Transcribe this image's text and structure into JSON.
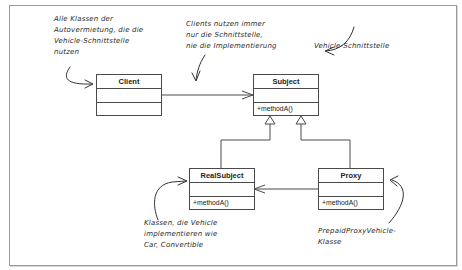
{
  "diagram": {
    "type": "UML class diagram (Proxy pattern)",
    "classes": [
      {
        "id": "client",
        "name": "Client",
        "attributes": "",
        "operations": ""
      },
      {
        "id": "subject",
        "name": "Subject",
        "attributes": "",
        "operations": "+methodA()"
      },
      {
        "id": "realsubject",
        "name": "RealSubject",
        "attributes": "",
        "operations": "+methodA()"
      },
      {
        "id": "proxy",
        "name": "Proxy",
        "attributes": "",
        "operations": "+methodA()"
      }
    ],
    "relations": [
      {
        "from": "Client",
        "to": "Subject",
        "type": "association"
      },
      {
        "from": "RealSubject",
        "to": "Subject",
        "type": "generalization"
      },
      {
        "from": "Proxy",
        "to": "Subject",
        "type": "generalization"
      },
      {
        "from": "Proxy",
        "to": "RealSubject",
        "type": "association"
      }
    ]
  },
  "annotations": {
    "client_note": [
      "Alle Klassen der",
      "Autovermietung, die die",
      "Vehicle-Schnittstelle",
      "nutzen"
    ],
    "interface_note": [
      "Clients nutzen immer",
      "nur die Schnittstelle,",
      "nie die Implementierung"
    ],
    "subject_note": [
      "Vehicle-Schnittstelle"
    ],
    "realsubject_note": [
      "Klassen, die Vehicle",
      "implementieren wie",
      "Car, Convertible"
    ],
    "proxy_note": [
      "PrepaidProxyVehicle-",
      "Klasse"
    ]
  },
  "colors": {
    "line": "#4a4a4a",
    "frame": "#9a9a9a",
    "text": "#222222"
  }
}
